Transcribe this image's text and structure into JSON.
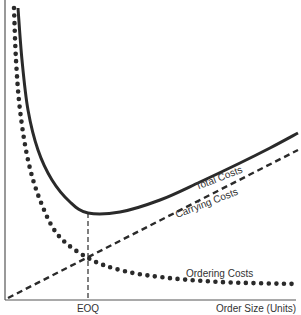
{
  "chart_data": {
    "type": "line",
    "title": "",
    "xlabel": "Order Size (Units)",
    "ylabel": "",
    "x_tick_labels": [
      "EOQ"
    ],
    "grid": false,
    "legend": "inline curve labels",
    "series": [
      {
        "name": "Total Costs",
        "style": "solid",
        "points": [
          [
            18,
            8
          ],
          [
            22,
            60
          ],
          [
            28,
            110
          ],
          [
            38,
            150
          ],
          [
            52,
            180
          ],
          [
            70,
            202
          ],
          [
            88,
            213
          ],
          [
            120,
            212
          ],
          [
            160,
            200
          ],
          [
            200,
            182
          ],
          [
            240,
            163
          ],
          [
            270,
            148
          ],
          [
            298,
            133
          ]
        ]
      },
      {
        "name": "Carrying Costs",
        "style": "dashed",
        "points": [
          [
            8,
            298
          ],
          [
            298,
            150
          ]
        ]
      },
      {
        "name": "Ordering Costs",
        "style": "dotted",
        "points": [
          [
            14,
            8
          ],
          [
            16,
            60
          ],
          [
            20,
            110
          ],
          [
            28,
            160
          ],
          [
            40,
            200
          ],
          [
            58,
            235
          ],
          [
            88,
            258
          ],
          [
            120,
            270
          ],
          [
            160,
            277
          ],
          [
            220,
            282
          ],
          [
            298,
            284
          ]
        ]
      }
    ],
    "annotations": [
      {
        "text": "EOQ",
        "type": "vertical-dashed-line",
        "x": 88,
        "from_y": 213,
        "to_y": 300
      }
    ],
    "labels": {
      "total": "Total Costs",
      "carrying": "Carrying Costs",
      "ordering": "Ordering Costs",
      "eoq": "EOQ",
      "xaxis": "Order Size (Units)"
    },
    "colors": {
      "ink": "#2a2a2a",
      "axis": "#555555"
    }
  }
}
